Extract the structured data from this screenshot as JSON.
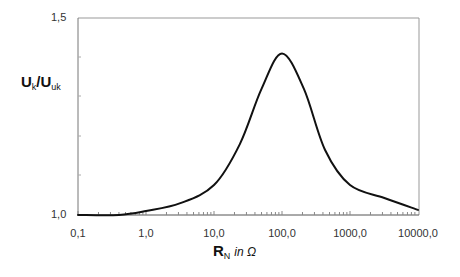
{
  "chart_data": {
    "type": "line",
    "title": "",
    "xlabel": "R_N in Ω",
    "ylabel": "U_k/U_uk",
    "xscale": "log",
    "xlim": [
      0.1,
      10000
    ],
    "ylim": [
      1.0,
      1.5
    ],
    "x_tick_labels": [
      "0,1",
      "1,0",
      "10,0",
      "100,0",
      "1000,0",
      "10000,0"
    ],
    "y_tick_labels": [
      "1,0",
      "1,5"
    ],
    "grid": false,
    "legend": null,
    "series": [
      {
        "name": "U_k/U_uk",
        "x": [
          0.1,
          0.4,
          1.0,
          3.2,
          10,
          24,
          50,
          100,
          210,
          430,
          1000,
          3200,
          10000
        ],
        "y": [
          1.0,
          1.0,
          1.01,
          1.03,
          1.076,
          1.18,
          1.32,
          1.41,
          1.32,
          1.165,
          1.076,
          1.043,
          1.013
        ]
      }
    ]
  },
  "labels": {
    "y_main": "U",
    "y_sub1": "k",
    "y_slash": "/U",
    "y_sub2": "uk",
    "x_main": "R",
    "x_sub": "N",
    "x_unit": "in  Ω",
    "ytick_top": "1,5",
    "ytick_bottom": "1,0",
    "xticks": [
      "0,1",
      "1,0",
      "10,0",
      "100,0",
      "1000,0",
      "10000,0"
    ]
  }
}
